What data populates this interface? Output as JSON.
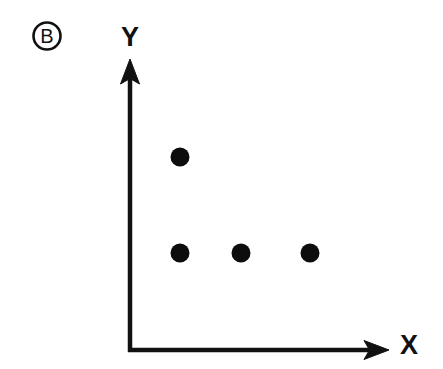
{
  "figure": {
    "panel_letter": "B",
    "background_color": "#ffffff",
    "ink_color": "#111111",
    "width": 443,
    "height": 369
  },
  "axes": {
    "x_label": "X",
    "y_label": "Y",
    "x_label_position": {
      "x": 408,
      "y": 345
    },
    "y_label_position": {
      "x": 130,
      "y": 36
    },
    "x_axis": {
      "x1": 130,
      "y1": 350,
      "x2": 388,
      "y2": 350,
      "arrow": "right"
    },
    "y_axis": {
      "x1": 130,
      "y1": 350,
      "x2": 130,
      "y2": 60,
      "arrow": "up"
    },
    "line_width": 4.5,
    "ticks": [],
    "tick_labels": [],
    "grid": false
  },
  "chart_data": {
    "type": "scatter",
    "title": "B",
    "xlabel": "X",
    "ylabel": "Y",
    "grid": false,
    "legend": null,
    "axis_arrows": true,
    "tick_labels_x": [],
    "tick_labels_y": [],
    "xlim": [
      0,
      4
    ],
    "ylim": [
      0,
      4
    ],
    "marker": "filled-circle",
    "marker_color": "#0d0d0d",
    "marker_radius_px": 9,
    "series": [
      {
        "name": "points",
        "points": [
          {
            "label": "p1",
            "x": 1,
            "y": 2,
            "px": 180,
            "py": 157
          },
          {
            "label": "p2",
            "x": 1,
            "y": 1,
            "px": 180,
            "py": 253
          },
          {
            "label": "p3",
            "x": 2,
            "y": 1,
            "px": 241,
            "py": 253
          },
          {
            "label": "p4",
            "x": 3,
            "y": 1,
            "px": 310,
            "py": 253
          }
        ]
      }
    ],
    "point_count": 4,
    "annotations": [
      {
        "name": "panel-letter",
        "text": "B",
        "shape": "circled",
        "px": 47,
        "py": 36
      }
    ]
  }
}
